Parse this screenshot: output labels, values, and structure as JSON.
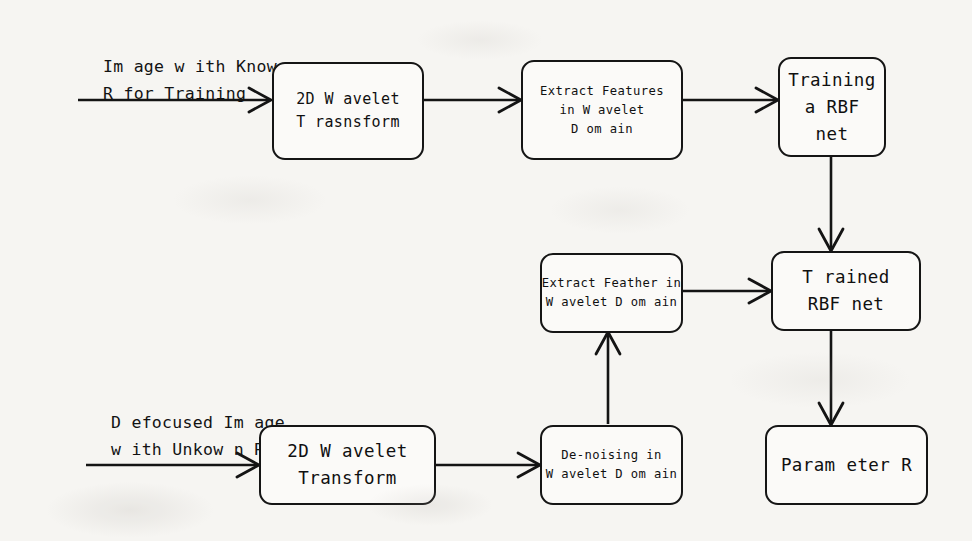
{
  "diagram": {
    "background_color": "#f6f5f2",
    "ink_color": "#141414",
    "captions": [
      {
        "id": "train-input",
        "line1": "Im age w ith Know n",
        "line2": "R for Training"
      },
      {
        "id": "test-input",
        "line1": "D efocused Im age",
        "line2": "w ith Unkow n R"
      }
    ],
    "nodes": [
      {
        "id": "wavelet-train",
        "lines": [
          "2D W avelet",
          "T rasnsform"
        ]
      },
      {
        "id": "extract-train",
        "lines": [
          "Extract Features",
          "in W avelet",
          "D om ain"
        ]
      },
      {
        "id": "train-rbf",
        "lines": [
          "Training",
          "a RBF",
          "net"
        ]
      },
      {
        "id": "extract-test",
        "lines": [
          "Extract Feather in",
          "W avelet D om ain"
        ]
      },
      {
        "id": "trained-rbf",
        "lines": [
          "T rained",
          "RBF net"
        ]
      },
      {
        "id": "wavelet-test",
        "lines": [
          "2D W avelet",
          "Transform"
        ]
      },
      {
        "id": "denoising",
        "lines": [
          "De-noising in",
          "W avelet D om ain"
        ]
      },
      {
        "id": "parameter-r",
        "lines": [
          "Param eter R"
        ]
      }
    ],
    "edges": [
      {
        "id": "edge-train-input-to-wavelet",
        "from": "train-input",
        "to": "wavelet-train",
        "direction": "right"
      },
      {
        "id": "edge-wavelet-to-extract",
        "from": "wavelet-train",
        "to": "extract-train",
        "direction": "right"
      },
      {
        "id": "edge-extract-to-train-rbf",
        "from": "extract-train",
        "to": "train-rbf",
        "direction": "right"
      },
      {
        "id": "edge-train-rbf-to-trained-rbf",
        "from": "train-rbf",
        "to": "trained-rbf",
        "direction": "down"
      },
      {
        "id": "edge-extract-test-to-trained",
        "from": "extract-test",
        "to": "trained-rbf",
        "direction": "right"
      },
      {
        "id": "edge-trained-to-parameter",
        "from": "trained-rbf",
        "to": "parameter-r",
        "direction": "down"
      },
      {
        "id": "edge-test-input-to-wavelet",
        "from": "test-input",
        "to": "wavelet-test",
        "direction": "right"
      },
      {
        "id": "edge-wavelet-test-to-denoising",
        "from": "wavelet-test",
        "to": "denoising",
        "direction": "right"
      },
      {
        "id": "edge-denoising-to-extract-test",
        "from": "denoising",
        "to": "extract-test",
        "direction": "up"
      }
    ]
  }
}
